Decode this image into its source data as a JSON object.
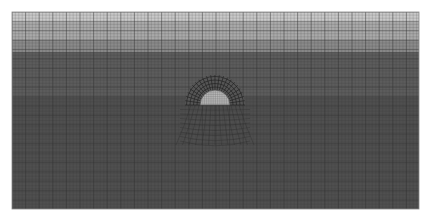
{
  "figure": {
    "background": "#ffffff",
    "mesh_bounds": {
      "x": 12,
      "y": 12,
      "width": 407,
      "height": 197
    },
    "bands": [
      {
        "y0": 12,
        "y1": 22,
        "color": "#c9c9c9"
      },
      {
        "y0": 22,
        "y1": 40,
        "color": "#a9a9a9"
      },
      {
        "y0": 40,
        "y1": 52,
        "color": "#8a8a8a"
      },
      {
        "y0": 52,
        "y1": 97,
        "color": "#5c5c5c"
      },
      {
        "y0": 97,
        "y1": 209,
        "color": "#4f4f4f"
      }
    ],
    "grid": {
      "coarse_dx": 13.6,
      "coarse_dy": 9.4,
      "fine_dx": 3.4,
      "fine_dy": 3.1,
      "line_color": "#333333"
    },
    "inclusion": {
      "cx": 215,
      "cy": 105,
      "r": 15,
      "fill": "#b8b8b8",
      "stroke": "#444444"
    },
    "radial_zone": {
      "inner_r": 15,
      "outer_r": 30,
      "spokes": 22,
      "color": "#222222"
    }
  }
}
